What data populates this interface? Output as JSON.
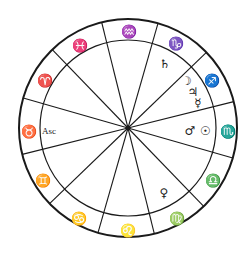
{
  "chart": {
    "center": {
      "x": 128,
      "y": 128
    },
    "outer_radius": 109,
    "inner_radius": 88,
    "line_color": "#1a1a1a",
    "house_cusp_angles_deg": [
      346,
      16,
      46,
      76,
      106,
      136,
      166,
      196,
      226,
      256,
      286,
      316
    ]
  },
  "signs": [
    {
      "name": "Aries",
      "glyph": "♈",
      "x": 45,
      "y": 80
    },
    {
      "name": "Pisces",
      "glyph": "♓",
      "x": 80,
      "y": 45
    },
    {
      "name": "Aquarius",
      "glyph": "♒",
      "x": 129,
      "y": 31
    },
    {
      "name": "Capricorn",
      "glyph": "♑",
      "x": 176,
      "y": 43
    },
    {
      "name": "Sagittarius",
      "glyph": "♐",
      "x": 212,
      "y": 80
    },
    {
      "name": "Scorpio",
      "glyph": "♏",
      "x": 228,
      "y": 131
    },
    {
      "name": "Libra",
      "glyph": "♎",
      "x": 213,
      "y": 180
    },
    {
      "name": "Virgo",
      "glyph": "♍",
      "x": 177,
      "y": 218
    },
    {
      "name": "Leo",
      "glyph": "♌",
      "x": 128,
      "y": 230
    },
    {
      "name": "Cancer",
      "glyph": "♋",
      "x": 79,
      "y": 218
    },
    {
      "name": "Gemini",
      "glyph": "♊",
      "x": 43,
      "y": 180
    },
    {
      "name": "Taurus",
      "glyph": "♉",
      "x": 29,
      "y": 131
    }
  ],
  "planets": [
    {
      "name": "Saturn",
      "glyph": "♄",
      "x": 165,
      "y": 64
    },
    {
      "name": "Moon",
      "glyph": "☽",
      "x": 186,
      "y": 81
    },
    {
      "name": "Jupiter",
      "glyph": "♃",
      "x": 193,
      "y": 92
    },
    {
      "name": "Mercury",
      "glyph": "☿",
      "x": 198,
      "y": 103
    },
    {
      "name": "Mars",
      "glyph": "♂",
      "x": 190,
      "y": 131
    },
    {
      "name": "Sun",
      "glyph": "☉",
      "x": 205,
      "y": 131
    },
    {
      "name": "Venus",
      "glyph": "♀",
      "x": 164,
      "y": 193
    }
  ],
  "ascendant": {
    "label": "Asc",
    "x": 49,
    "y": 131
  }
}
